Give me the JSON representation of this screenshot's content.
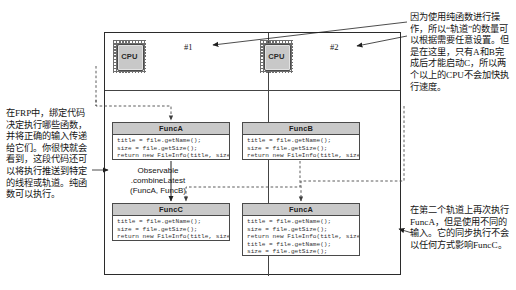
{
  "diagram": {
    "lanes": [
      {
        "label": "#1"
      },
      {
        "label": "#2"
      }
    ],
    "cpus": [
      {
        "label": "CPU"
      },
      {
        "label": "CPU"
      }
    ],
    "combine_caption": {
      "line1": "Observable",
      "line2": ".combineLatest",
      "line3": "(FuncA, FuncB)"
    },
    "boxes": [
      {
        "title": "FuncA",
        "code": [
          "title = file.getName();",
          "size = file.getSize();",
          "return new FileInfo(title, size);"
        ]
      },
      {
        "title": "FuncB",
        "code": [
          "title = file.getName();",
          "size = file.getSize();",
          "return new FileInfo(title, size);"
        ]
      },
      {
        "title": "FuncC",
        "code": [
          "title = file.getName();",
          "size = file.getSize();",
          "return new FileInfo(title, size);"
        ]
      },
      {
        "title": "FuncA",
        "code": [
          "title = file.getName();",
          "size = file.getSize();",
          "return new FileInfo(title, size);",
          "title = file.getName();",
          "size = file.getSize();"
        ]
      }
    ]
  },
  "notes": {
    "left": "在FRP中，绑定代码决定执行哪些函数，并将正确的输入传递给它们。你很快就会看到，这段代码还可以将执行推送到特定的线程或轨道。纯函数可以执行。",
    "top_right": "因为使用纯函数进行操作，所以“轨道”的数量可以根据需要任意设置。但是在这里，只有A和B完成后才能启动C，所以两个以上的CPU不会加快执行速度。",
    "bottom_right": "在第二个轨道上再次执行FuncA，但是使用不同的输入。它的同步执行不会以任何方式影响FuncC。"
  },
  "colors": {
    "line": "#2b2b2b",
    "header_fill": "#c9c9c9",
    "chip_body": "#c8c8c8",
    "dashed": "#555555",
    "text": "#151515"
  }
}
